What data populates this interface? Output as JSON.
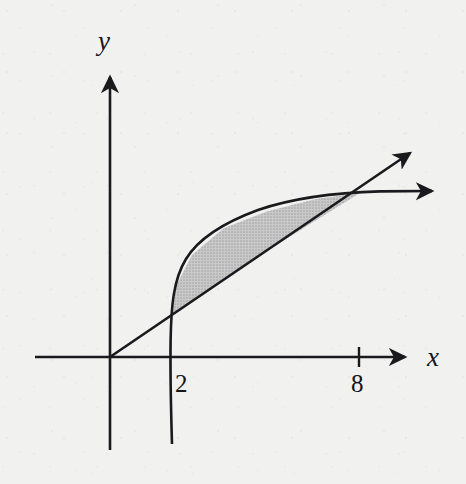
{
  "figure": {
    "title": "",
    "background_color": "#f1f1ef",
    "ink_color": "#1a1a1e",
    "shade_color": "#bcbcbc"
  },
  "axes": {
    "x_label": "x",
    "y_label": "y",
    "origin_px": [
      110,
      357
    ],
    "x_axis_from_px": [
      35,
      357
    ],
    "x_axis_to_px": [
      412,
      357
    ],
    "y_axis_from_px": [
      110,
      450
    ],
    "y_axis_to_px": [
      110,
      70
    ],
    "x_ticks": [
      {
        "label": "2",
        "x_px": 170,
        "has_tick_mark": false
      },
      {
        "label": "8",
        "x_px": 359,
        "has_tick_mark": true
      }
    ],
    "y_ticks": []
  },
  "chart_data": {
    "type": "line",
    "title": "",
    "xlabel": "x",
    "ylabel": "y",
    "grid": false,
    "legend": null,
    "annotations": [
      "2",
      "8"
    ],
    "xlim": [
      -1.6,
      9.6
    ],
    "ylim": [
      -3.0,
      6.5
    ],
    "series": [
      {
        "name": "line",
        "kind": "straight-line-through-origin",
        "description": "Straight ray from the origin rising to the upper right with an arrowhead; passes through the intersection point at x = 8.",
        "arrowhead": "end",
        "points_px": [
          [
            110,
            357
          ],
          [
            172,
            315
          ],
          [
            270,
            249
          ],
          [
            360,
            193
          ],
          [
            415,
            148
          ]
        ],
        "data_points": [
          [
            0,
            0
          ],
          [
            2,
            1.35
          ],
          [
            8,
            5.25
          ]
        ]
      },
      {
        "name": "curve",
        "kind": "increasing-concave-down",
        "description": "Steeply rising concave-down curve entering from below the x-axis near x = 2, flattening to the right with an arrowhead; crosses the line at x = 8.",
        "arrowhead": "end",
        "points_px": [
          [
            172,
            452
          ],
          [
            170,
            380
          ],
          [
            171,
            330
          ],
          [
            176,
            286
          ],
          [
            192,
            255
          ],
          [
            224,
            228
          ],
          [
            268,
            211
          ],
          [
            316,
            199
          ],
          [
            360,
            193
          ],
          [
            440,
            191
          ]
        ],
        "data_points": [
          [
            2,
            0
          ],
          [
            2.8,
            3.4
          ],
          [
            5,
            4.7
          ],
          [
            8,
            5.25
          ]
        ]
      }
    ],
    "shaded_regions": [
      {
        "name": "region-between-curves",
        "fill": "#bcbcbc",
        "pattern": "halftone-dots",
        "between": [
          "curve",
          "line"
        ],
        "x_range_px": [
          172,
          360
        ],
        "x_range_data": [
          2,
          8
        ],
        "description": "Gray shaded area enclosed between the curve (upper boundary) and the straight line (lower boundary) from x = 2 to x = 8."
      }
    ]
  }
}
